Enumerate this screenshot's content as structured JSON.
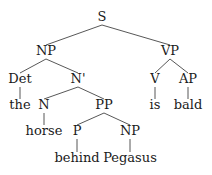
{
  "tree": {
    "nodes": [
      {
        "id": "S",
        "label": "S",
        "x": 102,
        "y": 10
      },
      {
        "id": "NP1",
        "label": "NP",
        "x": 46,
        "y": 44
      },
      {
        "id": "VP",
        "label": "VP",
        "x": 170,
        "y": 44
      },
      {
        "id": "Det",
        "label": "Det",
        "x": 20,
        "y": 72
      },
      {
        "id": "Nbar",
        "label": "N'",
        "x": 78,
        "y": 72
      },
      {
        "id": "V",
        "label": "V",
        "x": 155,
        "y": 72
      },
      {
        "id": "AP",
        "label": "AP",
        "x": 188,
        "y": 72
      },
      {
        "id": "the",
        "label": "the",
        "x": 20,
        "y": 98
      },
      {
        "id": "N",
        "label": "N",
        "x": 44,
        "y": 98
      },
      {
        "id": "PP",
        "label": "PP",
        "x": 104,
        "y": 98
      },
      {
        "id": "is",
        "label": "is",
        "x": 155,
        "y": 98
      },
      {
        "id": "bald",
        "label": "bald",
        "x": 188,
        "y": 98
      },
      {
        "id": "horse",
        "label": "horse",
        "x": 44,
        "y": 124
      },
      {
        "id": "P",
        "label": "P",
        "x": 77,
        "y": 124
      },
      {
        "id": "NP2",
        "label": "NP",
        "x": 130,
        "y": 124
      },
      {
        "id": "behind",
        "label": "behind",
        "x": 77,
        "y": 151
      },
      {
        "id": "Pegasus",
        "label": "Pegasus",
        "x": 130,
        "y": 151
      }
    ],
    "edges": [
      [
        "S",
        "NP1"
      ],
      [
        "S",
        "VP"
      ],
      [
        "NP1",
        "Det"
      ],
      [
        "NP1",
        "Nbar"
      ],
      [
        "VP",
        "V"
      ],
      [
        "VP",
        "AP"
      ],
      [
        "Det",
        "the"
      ],
      [
        "Nbar",
        "N"
      ],
      [
        "Nbar",
        "PP"
      ],
      [
        "V",
        "is"
      ],
      [
        "AP",
        "bald"
      ],
      [
        "N",
        "horse"
      ],
      [
        "PP",
        "P"
      ],
      [
        "PP",
        "NP2"
      ],
      [
        "P",
        "behind"
      ],
      [
        "NP2",
        "Pegasus"
      ]
    ]
  }
}
